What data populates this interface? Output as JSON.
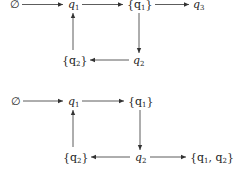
{
  "diagrams": [
    {
      "nodes": [
        {
          "id": "empty",
          "label": "∅",
          "x": 13,
          "y": 8
        },
        {
          "id": "q1",
          "label": "q",
          "sub": "1",
          "x": 73,
          "y": 8
        },
        {
          "id": "set_q1",
          "label": "{q",
          "sub": "1",
          "close": "}",
          "x": 137,
          "y": 8
        },
        {
          "id": "q3",
          "label": "q",
          "sub": "3",
          "x": 197,
          "y": 8
        },
        {
          "id": "set_q2",
          "label": "{q",
          "sub": "2",
          "close": "}",
          "x": 73,
          "y": 64
        },
        {
          "id": "q2",
          "label": "q",
          "sub": "2",
          "x": 138,
          "y": 64
        }
      ],
      "edges": [
        {
          "from": "empty",
          "to": "q1"
        },
        {
          "from": "q1",
          "to": "set_q1"
        },
        {
          "from": "set_q1",
          "to": "q3"
        },
        {
          "from": "set_q1",
          "to": "q2"
        },
        {
          "from": "q2",
          "to": "set_q2"
        },
        {
          "from": "set_q2",
          "to": "q1"
        }
      ]
    },
    {
      "nodes": [
        {
          "id": "empty",
          "label": "∅",
          "x": 14,
          "y": 104
        },
        {
          "id": "q1",
          "label": "q",
          "sub": "1",
          "x": 73,
          "y": 104
        },
        {
          "id": "set_q1",
          "label": "{q",
          "sub": "1",
          "close": "}",
          "x": 138,
          "y": 104
        },
        {
          "id": "set_q2",
          "label": "{q",
          "sub": "2",
          "close": "}",
          "x": 73,
          "y": 160
        },
        {
          "id": "q2",
          "label": "q",
          "sub": "2",
          "x": 139,
          "y": 160
        },
        {
          "id": "set_q1_q2",
          "label": "{q",
          "sub": "1",
          "mid": ", q",
          "sub2": "2",
          "close": "}",
          "x": 210,
          "y": 160
        }
      ],
      "edges": [
        {
          "from": "empty",
          "to": "q1"
        },
        {
          "from": "q1",
          "to": "set_q1"
        },
        {
          "from": "set_q1",
          "to": "q2"
        },
        {
          "from": "q2",
          "to": "set_q2"
        },
        {
          "from": "set_q2",
          "to": "q1"
        },
        {
          "from": "q2",
          "to": "set_q1_q2"
        }
      ]
    }
  ],
  "text": {
    "d1_empty": "∅",
    "d1_q1": "q",
    "d1_q1_sub": "1",
    "d1_setq1_open": "{q",
    "d1_setq1_sub": "1",
    "d1_setq1_close": "}",
    "d1_q3": "q",
    "d1_q3_sub": "3",
    "d1_setq2_open": "{q",
    "d1_setq2_sub": "2",
    "d1_setq2_close": "}",
    "d1_q2": "q",
    "d1_q2_sub": "2",
    "d2_empty": "∅",
    "d2_q1": "q",
    "d2_q1_sub": "1",
    "d2_setq1_open": "{q",
    "d2_setq1_sub": "1",
    "d2_setq1_close": "}",
    "d2_setq2_open": "{q",
    "d2_setq2_sub": "2",
    "d2_setq2_close": "}",
    "d2_q2": "q",
    "d2_q2_sub": "2",
    "d2_setq1q2_open": "{q",
    "d2_setq1q2_sub1": "1",
    "d2_setq1q2_mid": ", q",
    "d2_setq1q2_sub2": "2",
    "d2_setq1q2_close": "}"
  }
}
